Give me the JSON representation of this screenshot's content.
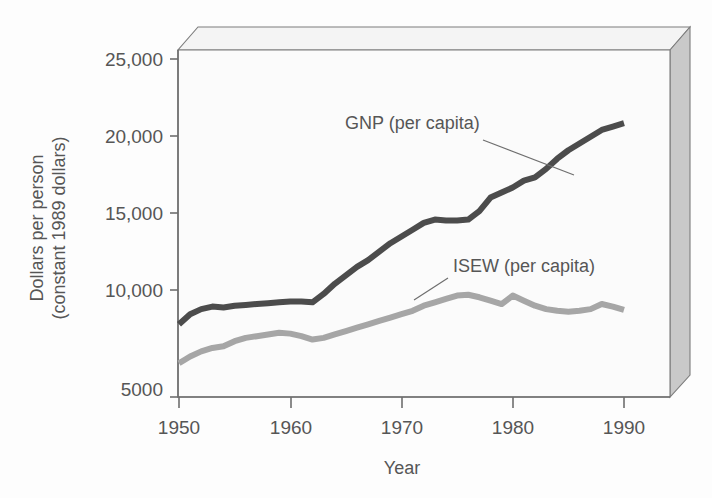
{
  "chart_data": {
    "type": "line",
    "title": "",
    "xlabel": "Year",
    "ylabel": "Dollars per person (constant 1989 dollars)",
    "ylabel_line1": "Dollars per person",
    "ylabel_line2": "(constant 1989 dollars)",
    "xlim": [
      1950,
      1990
    ],
    "ylim": [
      5000,
      25000
    ],
    "grid": false,
    "legend_position": "inline-annotations",
    "xticks": [
      1950,
      1960,
      1970,
      1980,
      1990
    ],
    "xtick_labels": [
      "1950",
      "1960",
      "1970",
      "1980",
      "1990"
    ],
    "yticks": [
      5000,
      10000,
      15000,
      20000,
      25000
    ],
    "ytick_labels": [
      "5000",
      "10,000",
      "15,000",
      "20,000",
      "25,000"
    ],
    "x": [
      1950,
      1951,
      1952,
      1953,
      1954,
      1955,
      1956,
      1957,
      1958,
      1959,
      1960,
      1961,
      1962,
      1963,
      1964,
      1965,
      1966,
      1967,
      1968,
      1969,
      1970,
      1971,
      1972,
      1973,
      1974,
      1975,
      1976,
      1977,
      1978,
      1979,
      1980,
      1981,
      1982,
      1983,
      1984,
      1985,
      1986,
      1987,
      1988,
      1989,
      1990
    ],
    "series": [
      {
        "name": "GNP (per capita)",
        "color": "#4c4c4c",
        "label_text": "GNP (per capita)",
        "values": [
          9300,
          9900,
          10200,
          10350,
          10300,
          10400,
          10450,
          10500,
          10550,
          10600,
          10650,
          10650,
          10600,
          11100,
          11700,
          12200,
          12700,
          13100,
          13600,
          14100,
          14500,
          14900,
          15300,
          15500,
          15450,
          15450,
          15500,
          16000,
          16800,
          17100,
          17400,
          17800,
          18000,
          18500,
          19100,
          19600,
          20000,
          20400,
          20800,
          21000,
          21200
        ]
      },
      {
        "name": "ISEW (per capita)",
        "color": "#a6a6a6",
        "label_text": "ISEW (per capita)",
        "values": [
          7000,
          7400,
          7700,
          7900,
          8000,
          8300,
          8500,
          8600,
          8700,
          8800,
          8750,
          8600,
          8400,
          8500,
          8700,
          8900,
          9100,
          9300,
          9500,
          9700,
          9900,
          10100,
          10400,
          10600,
          10800,
          11000,
          11050,
          10900,
          10700,
          10500,
          11000,
          10700,
          10400,
          10200,
          10100,
          10050,
          10100,
          10200,
          10500,
          10350,
          10150
        ]
      }
    ],
    "annotations": [
      {
        "text": "GNP (per capita)",
        "label_x": 345,
        "label_y": 129,
        "leader_from_x": 483,
        "leader_from_y": 140,
        "leader_to_x": 574,
        "leader_to_y": 175
      },
      {
        "text": "ISEW (per capita)",
        "label_x": 453,
        "label_y": 272,
        "leader_from_x": 448,
        "leader_from_y": 278,
        "leader_to_x": 414,
        "leader_to_y": 300
      }
    ]
  },
  "axis": {
    "x_title": "Year",
    "y_title_line1": "Dollars per person",
    "y_title_line2": "(constant 1989 dollars)"
  }
}
